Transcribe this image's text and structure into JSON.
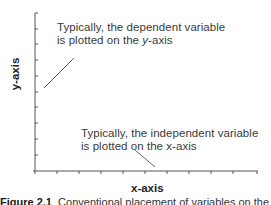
{
  "diagram": {
    "title": "",
    "y_axis_label": "y-axis",
    "x_axis_label": "x-axis",
    "annotations": [
      {
        "id": "dependent",
        "line1": "Typically, the dependent variable",
        "line2_prefix": "is plotted on the ",
        "line2_emph": "y",
        "line2_suffix": "-axis"
      },
      {
        "id": "independent",
        "line1": "Typically, the independent variable",
        "line2_prefix": "is plotted on the ",
        "line2_emph": "x",
        "line2_suffix": "-axis"
      }
    ],
    "y_tick_count": 11,
    "x_tick_count": 11,
    "colors": {
      "axis": "#555555",
      "text": "#3a3a3a",
      "leader": "#555555"
    }
  },
  "caption": {
    "figure_label": "Figure 2.1",
    "text": "Conventional placement of variables on the axes"
  }
}
